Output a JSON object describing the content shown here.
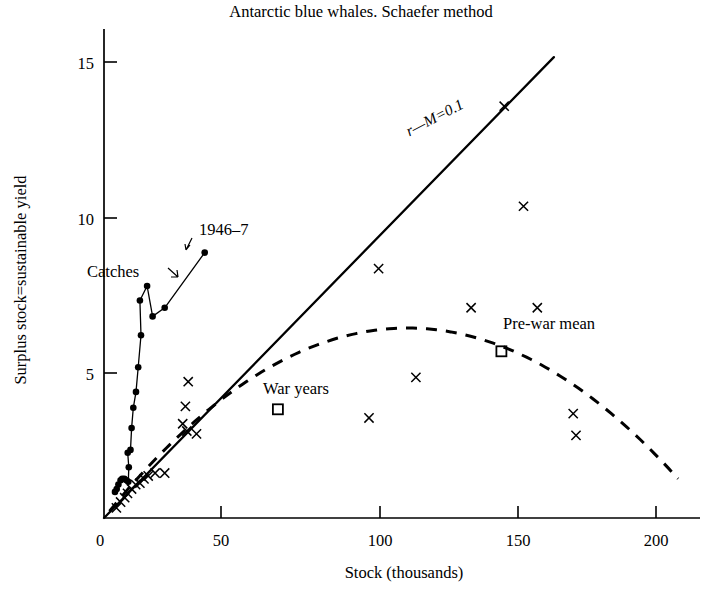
{
  "chart_data": {
    "type": "scatter",
    "title": "Antarctic blue whales. Schaefer method",
    "xlabel": "Stock (thousands)",
    "ylabel": "Surplus stock=sustainable yield",
    "xlim": [
      0,
      215
    ],
    "ylim": [
      0,
      16.2
    ],
    "xticks": [
      0,
      50,
      100,
      150,
      200
    ],
    "xticklabels": [
      "0",
      "50",
      "100",
      "150",
      "200"
    ],
    "yticks": [
      5,
      10,
      15
    ],
    "yticklabels": [
      "5",
      "10",
      "15"
    ],
    "grid": false,
    "legend": "none",
    "annotations": [
      {
        "name": "line-label",
        "text": "r—M=0.1",
        "x": 92,
        "y": 10.4,
        "rotation": -27.5
      },
      {
        "name": "catches-label",
        "text": "Catches",
        "x": 11,
        "y": 7.8
      },
      {
        "name": "year-label",
        "text": "1946–7",
        "x": 42,
        "y": 9.4
      },
      {
        "name": "war-years-label",
        "text": "War years",
        "x": 73,
        "y": 4.5
      },
      {
        "name": "pre-war-mean-label",
        "text": "Pre-war mean",
        "x": 152,
        "y": 6.6
      }
    ],
    "series": [
      {
        "name": "Annual observations",
        "marker": "x",
        "points": [
          [
            4.5,
            0.35
          ],
          [
            6.0,
            0.55
          ],
          [
            7.5,
            0.7
          ],
          [
            8.5,
            0.85
          ],
          [
            10.0,
            1.0
          ],
          [
            11.5,
            1.15
          ],
          [
            13.0,
            1.2
          ],
          [
            14.5,
            1.35
          ],
          [
            16.0,
            1.45
          ],
          [
            18.5,
            1.55
          ],
          [
            22.0,
            1.55
          ],
          [
            28.5,
            3.25
          ],
          [
            30.0,
            3.0
          ],
          [
            33.5,
            2.9
          ],
          [
            30.5,
            4.7
          ],
          [
            29.5,
            3.85
          ],
          [
            96.0,
            3.45
          ],
          [
            99.5,
            8.6
          ],
          [
            113.0,
            4.85
          ],
          [
            133.0,
            7.25
          ],
          [
            145.0,
            14.2
          ],
          [
            152.0,
            10.75
          ],
          [
            157.0,
            7.25
          ],
          [
            170.0,
            3.6
          ],
          [
            171.0,
            2.85
          ]
        ]
      },
      {
        "name": "War years",
        "marker": "open-square",
        "points": [
          [
            63.0,
            3.75
          ]
        ]
      },
      {
        "name": "Pre-war mean",
        "marker": "open-square",
        "points": [
          [
            144.0,
            5.75
          ]
        ]
      },
      {
        "name": "Catches",
        "marker": "filled-circle-line",
        "points": [
          [
            4.0,
            0.9
          ],
          [
            4.6,
            1.0
          ],
          [
            5.2,
            1.15
          ],
          [
            6.0,
            1.3
          ],
          [
            6.6,
            1.35
          ],
          [
            7.4,
            1.35
          ],
          [
            8.2,
            1.3
          ],
          [
            8.8,
            1.25
          ],
          [
            9.0,
            1.75
          ],
          [
            8.6,
            2.25
          ],
          [
            9.6,
            2.35
          ],
          [
            10.0,
            3.1
          ],
          [
            10.6,
            3.8
          ],
          [
            11.6,
            4.35
          ],
          [
            12.4,
            5.2
          ],
          [
            13.4,
            6.3
          ],
          [
            13.0,
            7.5
          ],
          [
            15.6,
            8.0
          ],
          [
            17.6,
            6.95
          ],
          [
            22.0,
            7.25
          ],
          [
            36.5,
            9.15
          ]
        ]
      }
    ],
    "curves": [
      {
        "name": "schaefer-parabola",
        "style": "dashed",
        "description": "Schaefer sustainable-yield parabola",
        "vertex": [
          110,
          6.55
        ],
        "xrange": [
          2,
          208
        ]
      },
      {
        "name": "replacement-line",
        "style": "solid",
        "description": "r-M=0.1 straight line through origin",
        "slope": 0.0975,
        "xrange": [
          0,
          163
        ]
      }
    ]
  }
}
